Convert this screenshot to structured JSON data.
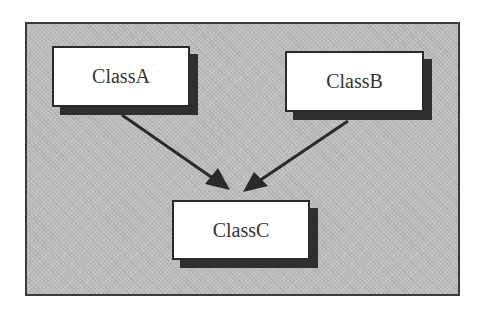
{
  "diagram": {
    "type": "class-inheritance",
    "nodes": [
      {
        "id": "classA",
        "label": "ClassA"
      },
      {
        "id": "classB",
        "label": "ClassB"
      },
      {
        "id": "classC",
        "label": "ClassC"
      }
    ],
    "edges": [
      {
        "from": "ClassA",
        "to": "ClassC"
      },
      {
        "from": "ClassB",
        "to": "ClassC"
      }
    ],
    "colors": {
      "background": "#bdbdbd",
      "box_fill": "#ffffff",
      "box_shadow": "#2f2f2f",
      "line": "#2a2a2a"
    }
  }
}
